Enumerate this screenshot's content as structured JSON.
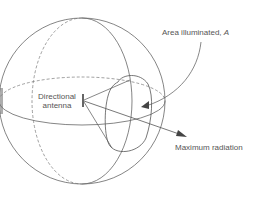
{
  "diagram": {
    "labels": {
      "area_illuminated": "Area illuminated, ",
      "area_symbol": "A",
      "directional_antenna_line1": "Directional",
      "directional_antenna_line2": "antenna",
      "maximum_radiation": "Maximum radiation"
    },
    "colors": {
      "stroke": "#666666",
      "text": "#555555",
      "background": "#ffffff"
    }
  }
}
